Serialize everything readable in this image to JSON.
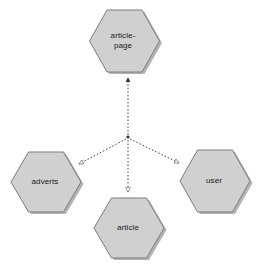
{
  "diagram": {
    "type": "dependency-diagram",
    "background_color": "#ffffff",
    "width": 256,
    "height": 271,
    "node_fill_color": "#d0d0d0",
    "node_stroke_color": "#808080",
    "node_shadow_color": "#b0b0b0",
    "edge_color": "#333333",
    "edge_style": "dashed",
    "label_color": "#1a1a1a",
    "junction": {
      "x": 128,
      "y": 137,
      "color": "#333333"
    },
    "nodes": [
      {
        "id": "article-page",
        "label": "article-\npage",
        "shape": "hexagon",
        "cx": 123,
        "cy": 41,
        "rx": 35,
        "ry": 31,
        "label_x": 88,
        "label_y": 31,
        "label_w": 70
      },
      {
        "id": "adverts",
        "label": "adverts",
        "shape": "hexagon",
        "cx": 45,
        "cy": 182,
        "rx": 35,
        "ry": 30,
        "label_x": 10,
        "label_y": 177,
        "label_w": 70
      },
      {
        "id": "user",
        "label": "user",
        "shape": "hexagon",
        "cx": 214,
        "cy": 181,
        "rx": 35,
        "ry": 31,
        "label_x": 179,
        "label_y": 176,
        "label_w": 70
      },
      {
        "id": "article",
        "label": "article",
        "shape": "hexagon",
        "cx": 128,
        "cy": 228,
        "rx": 35,
        "ry": 30,
        "label_x": 93,
        "label_y": 223,
        "label_w": 70
      }
    ],
    "edges": [
      {
        "id": "edge-to-article-page",
        "from": "junction",
        "to": "article-page",
        "arrowhead": "solid",
        "style": "dashed",
        "x1": 128,
        "y1": 135,
        "x2": 128,
        "y2": 78
      },
      {
        "id": "edge-to-adverts",
        "from": "junction",
        "to": "adverts",
        "arrowhead": "hollow",
        "style": "dashed",
        "x1": 126,
        "y1": 139,
        "x2": 79,
        "y2": 164
      },
      {
        "id": "edge-to-user",
        "from": "junction",
        "to": "user",
        "arrowhead": "hollow",
        "style": "dashed",
        "x1": 130,
        "y1": 139,
        "x2": 179,
        "y2": 163
      },
      {
        "id": "edge-to-article",
        "from": "junction",
        "to": "article",
        "arrowhead": "hollow",
        "style": "dashed",
        "x1": 128,
        "y1": 140,
        "x2": 128,
        "y2": 192
      }
    ]
  }
}
